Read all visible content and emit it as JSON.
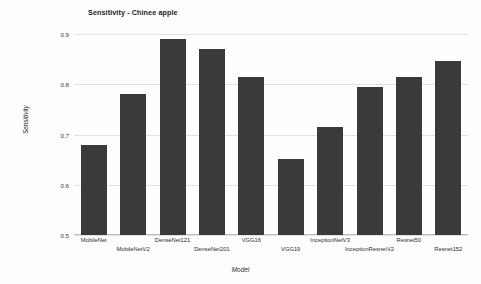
{
  "chart_data": {
    "type": "bar",
    "title": "Sensitivity - Chinee apple",
    "xlabel": "Model",
    "ylabel": "Sensitivity",
    "categories": [
      "MobileNet",
      "MobileNetV2",
      "DenseNet121",
      "DenseNet201",
      "VGG16",
      "VGG19",
      "InceptionNetV3",
      "InceptionResnetV2",
      "Resnet50",
      "Resnet152"
    ],
    "values": [
      0.68,
      0.78,
      0.89,
      0.87,
      0.815,
      0.652,
      0.715,
      0.795,
      0.815,
      0.846
    ],
    "ylim": [
      0.5,
      0.9
    ],
    "yticks": [
      "0.5",
      "0.6",
      "0.7",
      "0.8",
      "0.9"
    ],
    "ytick_values": [
      0.5,
      0.6,
      0.7,
      0.8,
      0.9
    ],
    "grid": true,
    "legend": false,
    "bar_color": "#3a3a3a",
    "grid_color": "#e2e2e2",
    "background_color": "#fdfdfd"
  }
}
